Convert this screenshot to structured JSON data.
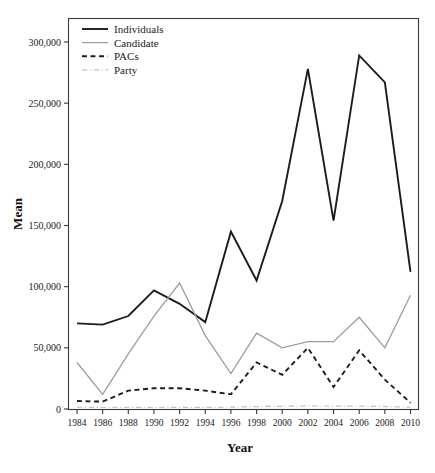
{
  "chart_data": {
    "type": "line",
    "title": "",
    "xlabel": "Year",
    "ylabel": "Mean",
    "x": [
      1984,
      1986,
      1988,
      1990,
      1992,
      1994,
      1996,
      1998,
      2000,
      2002,
      2004,
      2006,
      2008,
      2010
    ],
    "categories": [
      "1984",
      "1986",
      "1988",
      "1990",
      "1992",
      "1994",
      "1996",
      "1998",
      "2000",
      "2002",
      "2004",
      "2006",
      "2008",
      "2010"
    ],
    "xlim": [
      1984,
      2010
    ],
    "ylim": [
      0,
      300000
    ],
    "yticks": [
      0,
      50000,
      100000,
      150000,
      200000,
      250000,
      300000
    ],
    "ytick_labels": [
      "0",
      "50,000",
      "100,000",
      "150,000",
      "200,000",
      "250,000",
      "300,000"
    ],
    "grid": false,
    "legend_position": "top-left",
    "series": [
      {
        "name": "Individuals",
        "color": "#1c1c1c",
        "style": "solid",
        "width": 1.9,
        "values": [
          70000,
          69000,
          76000,
          97000,
          86000,
          71000,
          145000,
          105000,
          170000,
          278000,
          154000,
          289000,
          267000,
          112000
        ]
      },
      {
        "name": "Candidate",
        "color": "#9d9d9d",
        "style": "solid",
        "width": 1.3,
        "values": [
          38000,
          12000,
          45000,
          76000,
          103000,
          60000,
          29000,
          62000,
          50000,
          55000,
          55000,
          75000,
          50000,
          93000
        ]
      },
      {
        "name": "PACs",
        "color": "#1c1c1c",
        "style": "dashed",
        "width": 1.9,
        "values": [
          6500,
          6000,
          15000,
          17000,
          17000,
          15000,
          12000,
          38000,
          28000,
          50000,
          18000,
          48000,
          24000,
          5000
        ]
      },
      {
        "name": "Party",
        "color": "#c4c4c4",
        "style": "dashdot",
        "width": 1.2,
        "values": [
          1500,
          1200,
          1300,
          1200,
          1400,
          1300,
          1500,
          2000,
          2200,
          2500,
          2400,
          2300,
          2000,
          1500
        ]
      }
    ]
  },
  "legend": {
    "entries": [
      {
        "label": "Individuals"
      },
      {
        "label": "Candidate"
      },
      {
        "label": "PACs"
      },
      {
        "label": "Party"
      }
    ]
  },
  "axes": {
    "y_title": "Mean",
    "x_title": "Year"
  }
}
